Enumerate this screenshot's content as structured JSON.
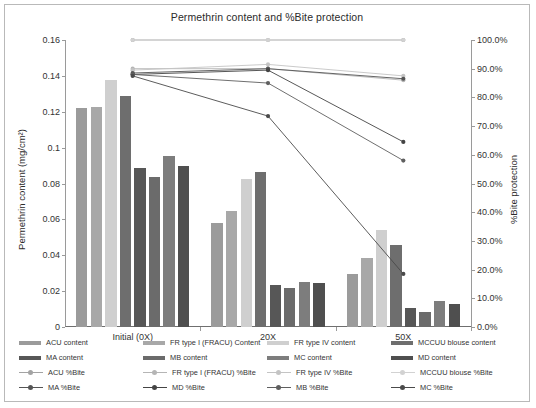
{
  "chart_data": {
    "type": "bar",
    "title": "Permethrin content and %Bite protection",
    "categories": [
      "Initial (0X)",
      "20X",
      "50X"
    ],
    "xlabel": "",
    "ylabel": "Permethrin content (mg/cm²)",
    "ylim": [
      0,
      0.16
    ],
    "yticks": [
      "0",
      "0.02",
      "0.04",
      "0.06",
      "0.08",
      "0.1",
      "0.12",
      "0.14",
      "0.16"
    ],
    "y2label": "%Bite protection",
    "y2lim": [
      0,
      100
    ],
    "y2ticks": [
      "0.0%",
      "10.0%",
      "20.0%",
      "30.0%",
      "40.0%",
      "50.0%",
      "60.0%",
      "70.0%",
      "80.0%",
      "90.0%",
      "100.0%"
    ],
    "grid": false,
    "legend_position": "bottom",
    "bar_series": [
      {
        "name": "ACU content",
        "color": "#9b9b9b",
        "values": [
          0.122,
          0.058,
          0.0295
        ]
      },
      {
        "name": "FR type I (FRACU) Content",
        "color": "#a8a8a8",
        "values": [
          0.1225,
          0.0645,
          0.0385
        ]
      },
      {
        "name": "FR type IV content",
        "color": "#cfcfcf",
        "values": [
          0.1375,
          0.0825,
          0.054
        ]
      },
      {
        "name": "MCCUU blouse content",
        "color": "#6e6e6e",
        "values": [
          0.129,
          0.0865,
          0.0455
        ]
      },
      {
        "name": "MA content",
        "color": "#575757",
        "values": [
          0.0885,
          0.0235,
          0.0105
        ]
      },
      {
        "name": "MB content",
        "color": "#6b6b6b",
        "values": [
          0.0835,
          0.0215,
          0.0085
        ]
      },
      {
        "name": "MC content",
        "color": "#7d7d7d",
        "values": [
          0.0955,
          0.025,
          0.0145
        ]
      },
      {
        "name": "MD content",
        "color": "#4f4f4f",
        "values": [
          0.0895,
          0.0245,
          0.013
        ]
      }
    ],
    "line_series": [
      {
        "name": "ACU %Bite",
        "color": "#a3a3a3",
        "values": [
          100.0,
          100.0,
          100.0
        ]
      },
      {
        "name": "FR type I (FRACU) %Bite",
        "color": "#b5b5b5",
        "values": [
          90.0,
          90.0,
          86.0
        ]
      },
      {
        "name": "FR type IV %Bite",
        "color": "#c4c4c4",
        "values": [
          89.5,
          91.5,
          87.5
        ]
      },
      {
        "name": "MCCUU blouse %Bite",
        "color": "#d2d2d2",
        "values": [
          100.0,
          100.0,
          100.0
        ]
      },
      {
        "name": "MA %Bite",
        "color": "#555555",
        "values": [
          88.5,
          90.0,
          86.5
        ]
      },
      {
        "name": "MD %Bite",
        "color": "#444444",
        "values": [
          88.0,
          89.5,
          64.5
        ]
      },
      {
        "name": "MB %Bite",
        "color": "#5f5f5f",
        "values": [
          88.0,
          85.0,
          58.0
        ]
      },
      {
        "name": "MC %Bite",
        "color": "#4a4a4a",
        "values": [
          87.5,
          73.5,
          18.5
        ]
      }
    ]
  },
  "legend": {
    "rows": [
      [
        {
          "label": "ACU content",
          "kind": "swatch",
          "color": "#9b9b9b"
        },
        {
          "label": "FR type I (FRACU) Content",
          "kind": "swatch",
          "color": "#a8a8a8"
        },
        {
          "label": "FR type IV content",
          "kind": "swatch",
          "color": "#cfcfcf"
        },
        {
          "label": "MCCUU blouse content",
          "kind": "swatch",
          "color": "#6e6e6e"
        }
      ],
      [
        {
          "label": "MA content",
          "kind": "swatch",
          "color": "#575757"
        },
        {
          "label": "MB content",
          "kind": "swatch",
          "color": "#6b6b6b"
        },
        {
          "label": "MC content",
          "kind": "swatch",
          "color": "#7d7d7d"
        },
        {
          "label": "MD content",
          "kind": "swatch",
          "color": "#4f4f4f"
        }
      ],
      [
        {
          "label": "ACU %Bite",
          "kind": "line",
          "color": "#a3a3a3"
        },
        {
          "label": "FR type I (FRACU) %Bite",
          "kind": "line",
          "color": "#b5b5b5"
        },
        {
          "label": "FR type IV %Bite",
          "kind": "line",
          "color": "#c4c4c4"
        },
        {
          "label": "MCCUU blouse %Bite",
          "kind": "line",
          "color": "#d2d2d2"
        }
      ],
      [
        {
          "label": "MA %Bite",
          "kind": "line",
          "color": "#555555"
        },
        {
          "label": "MD %Bite",
          "kind": "line",
          "color": "#444444"
        },
        {
          "label": "MB %Bite",
          "kind": "line",
          "color": "#5f5f5f"
        },
        {
          "label": "MC %Bite",
          "kind": "line",
          "color": "#4a4a4a"
        }
      ]
    ]
  }
}
